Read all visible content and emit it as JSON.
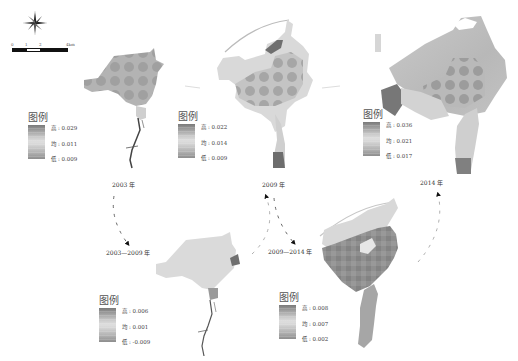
{
  "figure": {
    "compass": {
      "icon": "north-arrow-compass-icon"
    },
    "scale_bar": {
      "ticks": [
        "0",
        "1",
        "2",
        "4km"
      ]
    },
    "panels": [
      {
        "id": "2003",
        "year_label": "2003 年",
        "legend": {
          "title": "图例",
          "high": {
            "key": "高",
            "value": "0.029"
          },
          "mid": {
            "key": "均",
            "value": "0.011"
          },
          "low": {
            "key": "低",
            "value": "0.009"
          }
        }
      },
      {
        "id": "2009",
        "year_label": "2009 年",
        "legend": {
          "title": "图例",
          "high": {
            "key": "高",
            "value": "0.022"
          },
          "mid": {
            "key": "均",
            "value": "0.014"
          },
          "low": {
            "key": "低",
            "value": "0.009"
          }
        }
      },
      {
        "id": "2014",
        "year_label": "2014 年",
        "legend": {
          "title": "图例",
          "high": {
            "key": "高",
            "value": "0.036"
          },
          "mid": {
            "key": "均",
            "value": "0.021"
          },
          "low": {
            "key": "低",
            "value": "0.017"
          }
        }
      },
      {
        "id": "2003-2009",
        "year_label": "2003—2009 年",
        "legend": {
          "title": "图例",
          "high": {
            "key": "高",
            "value": "0.006"
          },
          "mid": {
            "key": "均",
            "value": "0.001"
          },
          "low": {
            "key": "低",
            "value": "-0.009"
          }
        }
      },
      {
        "id": "2009-2014",
        "year_label": "2009—2014 年",
        "legend": {
          "title": "图例",
          "high": {
            "key": "高",
            "value": "0.008"
          },
          "mid": {
            "key": "均",
            "value": "0.007"
          },
          "low": {
            "key": "低",
            "value": "0.002"
          }
        }
      }
    ],
    "colors": {
      "high": "#6e6e6e",
      "mid": "#dcdcdc",
      "low": "#8c8c8c",
      "arrow": "#111111"
    }
  }
}
